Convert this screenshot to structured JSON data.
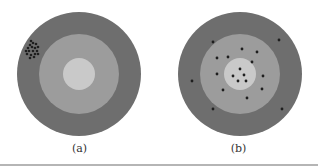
{
  "colors": {
    "outer_ring": "#6e6e6e",
    "middle_ring": "#9c9c9c",
    "inner_circle": "#c9c9c9",
    "dot": "#1e1e1e"
  },
  "panels": [
    {
      "id": "a",
      "caption": "(a)",
      "description": "Target with a tight cluster of hits in the upper-left outer ring (precise but not accurate)"
    },
    {
      "id": "b",
      "caption": "(b)",
      "description": "Target with hits scattered across all rings (neither clustered nor centered)"
    }
  ]
}
